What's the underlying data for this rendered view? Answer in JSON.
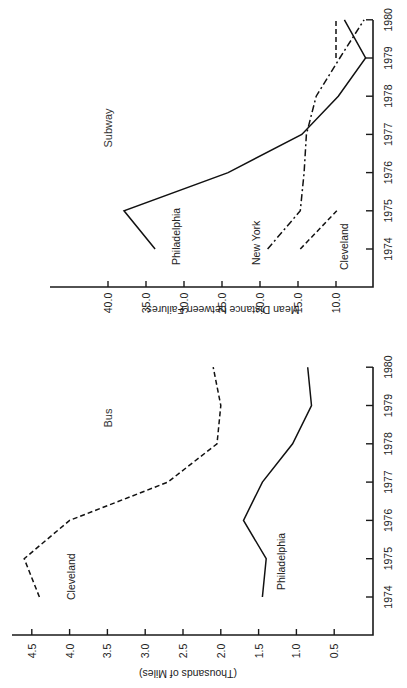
{
  "chart_data": [
    {
      "type": "line",
      "title": "Subway",
      "xlabel": "",
      "ylabel": "Mean Distance between Failures",
      "categories": [
        "1974",
        "1975",
        "1976",
        "1977",
        "1978",
        "1979",
        "1980"
      ],
      "x": [
        1974,
        1975,
        1976,
        1977,
        1978,
        1979,
        1980
      ],
      "yticks": [
        "10.0",
        "15.0",
        "20.0",
        "25.0",
        "30.0",
        "35.0",
        "40.0"
      ],
      "ylim": [
        5,
        45
      ],
      "grid": false,
      "orientation": "rotated 90° counter-clockwise",
      "series": [
        {
          "name": "Philadelphia",
          "style": "solid",
          "values": [
            33.8,
            37.9,
            24.2,
            14.5,
            9.7,
            6.1,
            8.9
          ]
        },
        {
          "name": "New York",
          "style": "dash-dot",
          "values": [
            19.0,
            14.7,
            14.2,
            13.9,
            12.6,
            9.5,
            6.3
          ]
        },
        {
          "name": "Cleveland",
          "style": "dashed",
          "values": [
            14.7,
            9.9,
            null,
            null,
            null,
            10.0,
            10.0
          ]
        }
      ]
    },
    {
      "type": "line",
      "title": "Bus",
      "xlabel": "",
      "ylabel": "(Thousands of Miles)",
      "categories": [
        "1974",
        "1975",
        "1976",
        "1977",
        "1978",
        "1979",
        "1980"
      ],
      "x": [
        1974,
        1975,
        1976,
        1977,
        1978,
        1979,
        1980
      ],
      "yticks": [
        "0.5",
        "1.0",
        "1.5",
        "2.0",
        "2.5",
        "3.0",
        "3.5",
        "4.0",
        "4.5"
      ],
      "ylim": [
        0,
        4.8
      ],
      "grid": false,
      "orientation": "rotated 90° counter-clockwise",
      "series": [
        {
          "name": "Cleveland",
          "style": "dashed",
          "values": [
            4.4,
            4.6,
            4.0,
            2.7,
            2.05,
            2.0,
            2.1
          ]
        },
        {
          "name": "Philadelphia",
          "style": "solid",
          "values": [
            1.45,
            1.4,
            1.7,
            1.45,
            1.05,
            0.8,
            0.85
          ]
        }
      ]
    }
  ],
  "labels": {
    "subway_title": "Subway",
    "subway_ylabel": "Mean Distance between Failures",
    "subway_philadelphia": "Philadelphia",
    "subway_newyork": "New York",
    "subway_cleveland": "Cleveland",
    "bus_title": "Bus",
    "bus_ylabel": "(Thousands of Miles)",
    "bus_cleveland": "Cleveland",
    "bus_philadelphia": "Philadelphia"
  }
}
